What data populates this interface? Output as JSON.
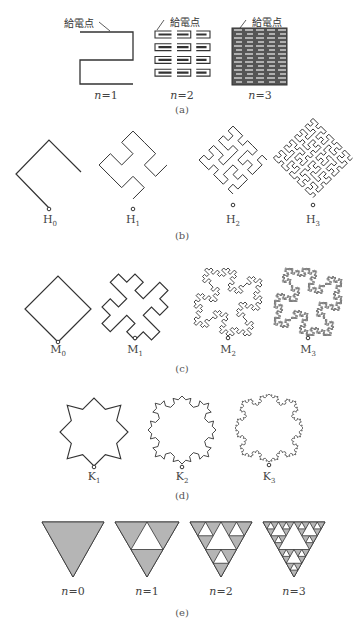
{
  "section_a": {
    "feed_label": "給電点",
    "labels": [
      "n=1",
      "n=2",
      "n=3"
    ],
    "caption": "(a)"
  },
  "section_b": {
    "labels": [
      {
        "base": "H",
        "sub": "0"
      },
      {
        "base": "H",
        "sub": "1"
      },
      {
        "base": "H",
        "sub": "2"
      },
      {
        "base": "H",
        "sub": "3"
      }
    ],
    "caption": "(b)"
  },
  "section_c": {
    "labels": [
      {
        "base": "M",
        "sub": "0"
      },
      {
        "base": "M",
        "sub": "1"
      },
      {
        "base": "M",
        "sub": "2"
      },
      {
        "base": "M",
        "sub": "3"
      }
    ],
    "caption": "(c)"
  },
  "section_d": {
    "labels": [
      {
        "base": "K",
        "sub": "1"
      },
      {
        "base": "K",
        "sub": "2"
      },
      {
        "base": "K",
        "sub": "3"
      }
    ],
    "caption": "(d)"
  },
  "section_e": {
    "labels": [
      "n=0",
      "n=1",
      "n=2",
      "n=3"
    ],
    "caption": "(e)",
    "fill_color": "#b5b5b5"
  },
  "colors": {
    "line": "#333333",
    "fill": "#b5b5b5"
  }
}
